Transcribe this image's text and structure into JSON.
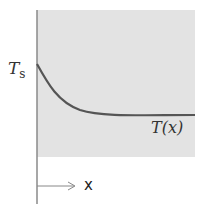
{
  "diagram": {
    "labels": {
      "ts_main": "T",
      "ts_sub": "s",
      "curve": "T(x)",
      "axis_x": "x"
    },
    "colors": {
      "region_fill": "#e3e3e3",
      "curve": "#555555",
      "axis": "#888888"
    }
  }
}
